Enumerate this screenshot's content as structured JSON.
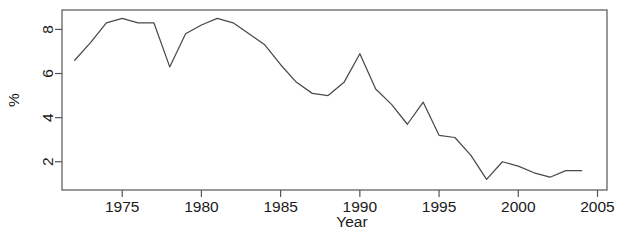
{
  "chart_data": {
    "type": "line",
    "title": "",
    "subtitle": "",
    "xlabel": "Year",
    "ylabel": "%",
    "xlim": [
      1971.2,
      2005.6
    ],
    "ylim": [
      0.72,
      8.88
    ],
    "grid": false,
    "legend": null,
    "annotations": [],
    "xticks": [
      1975,
      1980,
      1985,
      1990,
      1995,
      2000,
      2005
    ],
    "xtick_labels": [
      "1975",
      "1980",
      "1985",
      "1990",
      "1995",
      "2000",
      "2005"
    ],
    "yticks": [
      2,
      4,
      6,
      8
    ],
    "ytick_labels": [
      "2",
      "4",
      "6",
      "8"
    ],
    "x": [
      1972,
      1973,
      1974,
      1975,
      1976,
      1977,
      1978,
      1979,
      1980,
      1981,
      1982,
      1983,
      1984,
      1985,
      1986,
      1987,
      1988,
      1989,
      1990,
      1991,
      1992,
      1993,
      1994,
      1995,
      1996,
      1997,
      1998,
      1999,
      2000,
      2001,
      2002,
      2003,
      2004
    ],
    "series": [
      {
        "name": "%",
        "color": "#4a4a4a",
        "values": [
          6.6,
          7.4,
          8.3,
          8.5,
          8.3,
          8.3,
          6.3,
          7.8,
          8.2,
          8.5,
          8.3,
          7.8,
          7.3,
          6.4,
          5.6,
          5.1,
          5.0,
          5.6,
          6.9,
          5.3,
          4.6,
          3.7,
          4.7,
          3.2,
          3.1,
          2.3,
          1.2,
          2.0,
          1.8,
          1.5,
          1.3,
          1.6,
          1.6
        ]
      }
    ]
  },
  "axes": {
    "x_title": "Year",
    "y_title": "%"
  },
  "colors": {
    "line": "#4a4a4a",
    "axis": "#555555",
    "text": "#1a1a1a",
    "background": "#ffffff"
  }
}
